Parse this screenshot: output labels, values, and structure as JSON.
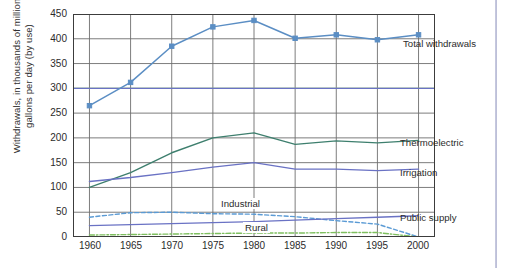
{
  "chart_data": {
    "type": "line",
    "title": "",
    "xlabel": "",
    "ylabel": "Withdrawals, in thousands of million gallons per day (by use)",
    "x": [
      1960,
      1965,
      1970,
      1975,
      1980,
      1985,
      1990,
      1995,
      2000
    ],
    "xlim": [
      1958,
      2002
    ],
    "ylim": [
      0,
      450
    ],
    "yticks": [
      0,
      50,
      100,
      150,
      200,
      250,
      300,
      350,
      400,
      450
    ],
    "xticks": [
      "1960",
      "1965",
      "1970",
      "1975",
      "1980",
      "1985",
      "1990",
      "1995",
      "2000"
    ],
    "grid": true,
    "legend_position": "inline-right",
    "series": [
      {
        "name": "Total withdrawals",
        "color": "#5b8ec4",
        "style": "solid-markers",
        "values": [
          265,
          312,
          385,
          424,
          437,
          401,
          408,
          398,
          408
        ]
      },
      {
        "name": "Thermoelectric",
        "color": "#3e7f6e",
        "style": "solid",
        "values": [
          100,
          130,
          170,
          200,
          210,
          187,
          194,
          190,
          195
        ]
      },
      {
        "name": "Irrigation",
        "color": "#6a72c4",
        "style": "solid",
        "values": [
          112,
          120,
          130,
          141,
          150,
          137,
          137,
          134,
          137
        ]
      },
      {
        "name": "Industrial",
        "color": "#5b9bd5",
        "style": "dashed",
        "values": [
          40,
          49,
          50,
          47,
          46,
          41,
          33,
          26,
          0
        ]
      },
      {
        "name": "Public supply",
        "color": "#6a72c4",
        "style": "solid",
        "values": [
          23,
          25,
          27,
          29,
          31,
          34,
          37,
          40,
          43
        ]
      },
      {
        "name": "Rural",
        "color": "#7fbf5f",
        "style": "dash-dot",
        "values": [
          4,
          5,
          6,
          7,
          8,
          8,
          9,
          9,
          0
        ]
      }
    ],
    "reference_lines": [
      {
        "name": "green-300-line",
        "y": 300,
        "color": "#8fcf6f"
      },
      {
        "name": "blue-300-line",
        "y": 300,
        "color": "#6a72c4"
      }
    ],
    "annotations": [
      {
        "name": "industrial-inline-label",
        "text": "Industrial",
        "x": 1978.2,
        "y": 60
      },
      {
        "name": "rural-inline-label",
        "text": "Rural",
        "x": 1981.2,
        "y": 18
      }
    ]
  },
  "labels": {
    "total_withdrawals": "Total withdrawals",
    "thermoelectric": "Thermoelectric",
    "irrigation": "Irrigation",
    "public_supply": "Public supply",
    "industrial": "Industrial",
    "rural": "Rural"
  },
  "axis": {
    "y_title": "Withdrawals, in thousands of million gallons per day (by use)",
    "y_ticks": [
      "450",
      "400",
      "350",
      "300",
      "250",
      "200",
      "150",
      "100",
      "50",
      "0"
    ],
    "x_ticks": [
      "1960",
      "1965",
      "1970",
      "1975",
      "1980",
      "1985",
      "1990",
      "1995",
      "2000"
    ]
  },
  "colors": {
    "total": "#5b8ec4",
    "thermoelectric": "#3e7f6e",
    "irrigation": "#6a72c4",
    "industrial": "#5b9bd5",
    "public_supply": "#6a72c4",
    "rural": "#7fbf5f",
    "grid": "#6e6e6e",
    "axis": "#3c3c3c"
  }
}
